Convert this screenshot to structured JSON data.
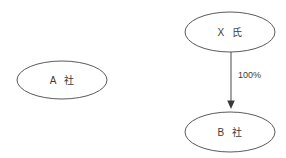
{
  "diagram": {
    "type": "ownership-structure-diagram",
    "background_color": "#ffffff",
    "stroke_color": "#5a5a5a",
    "text_color": "#3b3b3b",
    "nodes": [
      {
        "id": "company-a",
        "label": "A 社",
        "shape": "ellipse",
        "cx": 62,
        "cy": 80,
        "rx": 45,
        "ry": 19
      },
      {
        "id": "person-x",
        "label": "X 氏",
        "shape": "ellipse",
        "cx": 230,
        "cy": 32,
        "rx": 45,
        "ry": 20
      },
      {
        "id": "company-b",
        "label": "B 社",
        "shape": "ellipse",
        "cx": 230,
        "cy": 132,
        "rx": 45,
        "ry": 20
      }
    ],
    "edges": [
      {
        "id": "edge-x-to-b",
        "from": "person-x",
        "to": "company-b",
        "label": "100%",
        "label_x": 238,
        "label_y": 76,
        "x": 231,
        "y1": 52,
        "y2": 108,
        "arrow": "filled-triangle"
      }
    ]
  }
}
